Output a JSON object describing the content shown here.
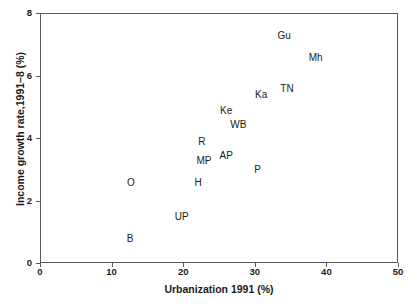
{
  "chart_data": {
    "type": "scatter",
    "title": "",
    "xlabel": "Urbanization 1991 (%)",
    "ylabel": "Income growth rate,1991–8 (%)",
    "xlim": [
      0,
      50
    ],
    "ylim": [
      0,
      8
    ],
    "xticks": [
      0,
      10,
      20,
      30,
      40,
      50
    ],
    "yticks": [
      0,
      2,
      4,
      6,
      8
    ],
    "xtick_labels": [
      "0",
      "10",
      "20",
      "30",
      "40",
      "50"
    ],
    "ytick_labels": [
      "0",
      "2",
      "4",
      "6",
      "8"
    ],
    "grid": false,
    "legend": "none",
    "marker_style": "text-label-only",
    "points": [
      {
        "label": "Gu",
        "x": 34.1,
        "y": 7.3
      },
      {
        "label": "Mh",
        "x": 38.5,
        "y": 6.6
      },
      {
        "label": "TN",
        "x": 34.5,
        "y": 5.6
      },
      {
        "label": "Ka",
        "x": 30.9,
        "y": 5.4
      },
      {
        "label": "Ke",
        "x": 26.0,
        "y": 4.9
      },
      {
        "label": "WB",
        "x": 27.7,
        "y": 4.45
      },
      {
        "label": "R",
        "x": 22.6,
        "y": 3.9
      },
      {
        "label": "AP",
        "x": 26.0,
        "y": 3.45
      },
      {
        "label": "MP",
        "x": 22.9,
        "y": 3.3
      },
      {
        "label": "P",
        "x": 30.4,
        "y": 3.0
      },
      {
        "label": "O",
        "x": 12.7,
        "y": 2.6
      },
      {
        "label": "H",
        "x": 22.1,
        "y": 2.6
      },
      {
        "label": "UP",
        "x": 19.8,
        "y": 1.5
      },
      {
        "label": "B",
        "x": 12.6,
        "y": 0.8
      }
    ],
    "colors": {
      "axis": "#59595b",
      "text": "#1a1a1a",
      "background": "#ffffff"
    }
  },
  "geometry": {
    "plot_left_px": 40,
    "plot_top_px": 13,
    "plot_width_px": 358,
    "plot_height_px": 250
  }
}
